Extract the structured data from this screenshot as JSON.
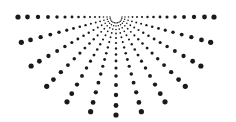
{
  "figure": {
    "background": "#ffffff",
    "dot_color": "#1a1a1a",
    "center": [
      116,
      17
    ],
    "ray_angles_deg": [
      0,
      15,
      30,
      45,
      60,
      75,
      90,
      105,
      120,
      135,
      150,
      165,
      180
    ],
    "radii": [
      6,
      9,
      12.5,
      16.5,
      21,
      26,
      31.5,
      37.5,
      44,
      51,
      59,
      68,
      78,
      88.5,
      98
    ],
    "min_dot_radius": 0.6,
    "max_dot_radius": 2.6
  }
}
